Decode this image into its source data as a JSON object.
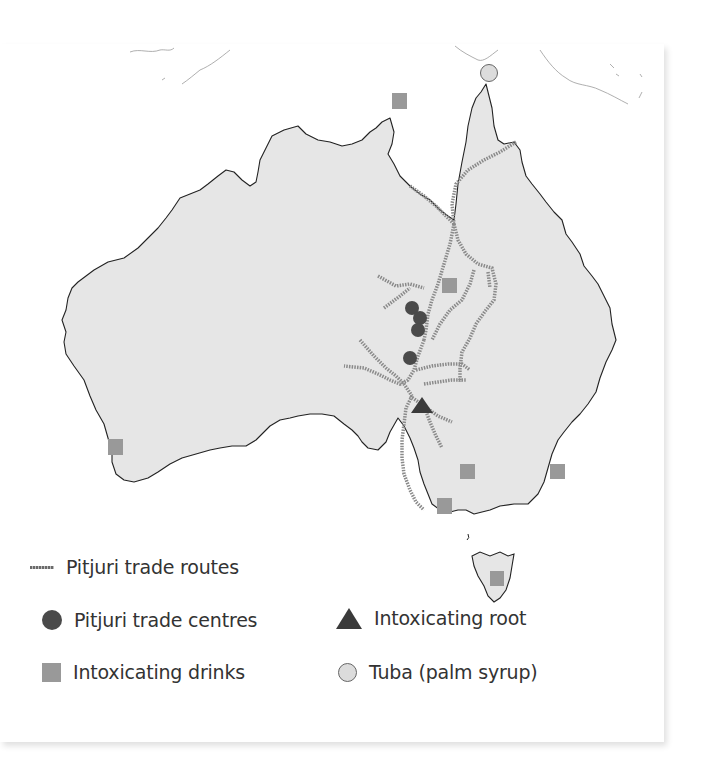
{
  "map": {
    "title_visible": false,
    "region": "Australia",
    "colors": {
      "land": "#e6e6e6",
      "coast": "#222222",
      "route_dark": "#6a6a6a",
      "route_light": "#b5b5b5",
      "trade_centre": "#4a4a4a",
      "drink_square": "#999999",
      "root_triangle": "#3a3a3a",
      "tuba_circle": "#dcdcdc"
    },
    "markers": {
      "trade_centres": [
        {
          "x": 412,
          "y": 308
        },
        {
          "x": 420,
          "y": 318
        },
        {
          "x": 418,
          "y": 329
        },
        {
          "x": 410,
          "y": 358
        }
      ],
      "drinks": [
        {
          "x": 400,
          "y": 57,
          "label": "Gulf of Carpentaria"
        },
        {
          "x": 449,
          "y": 241
        },
        {
          "x": 115,
          "y": 402
        },
        {
          "x": 467,
          "y": 427
        },
        {
          "x": 557,
          "y": 427
        },
        {
          "x": 445,
          "y": 461
        },
        {
          "x": 497,
          "y": 535
        }
      ],
      "roots": [
        {
          "x": 422,
          "y": 407
        }
      ],
      "tuba": [
        {
          "x": 489,
          "y": 29
        }
      ]
    }
  },
  "legend": {
    "items": [
      {
        "id": "routes",
        "label": "Pitjuri trade routes",
        "icon": "dotted-line-icon"
      },
      {
        "id": "centres",
        "label": "Pitjuri trade centres",
        "icon": "dark-circle-icon"
      },
      {
        "id": "root",
        "label": "Intoxicating root",
        "icon": "triangle-icon"
      },
      {
        "id": "drinks",
        "label": "Intoxicating drinks",
        "icon": "gray-square-icon"
      },
      {
        "id": "tuba",
        "label": "Tuba (palm syrup)",
        "icon": "light-circle-icon"
      }
    ]
  }
}
